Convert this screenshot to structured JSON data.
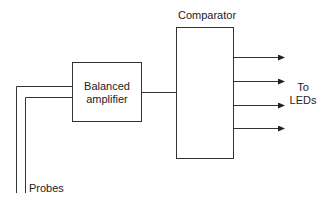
{
  "diagram": {
    "type": "block-diagram",
    "blocks": [
      {
        "id": "balanced-amplifier",
        "label_lines": [
          "Balanced",
          "amplifier"
        ]
      },
      {
        "id": "comparator",
        "label": "Comparator"
      }
    ],
    "inputs": {
      "label": "Probes",
      "count": 2
    },
    "outputs": {
      "label_lines": [
        "To",
        "LEDs"
      ],
      "count": 4
    },
    "colors": {
      "line": "#333333",
      "text": "#222222",
      "background": "#ffffff"
    }
  }
}
